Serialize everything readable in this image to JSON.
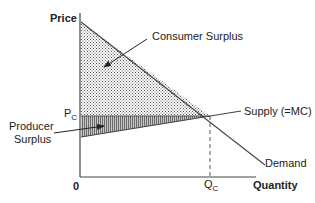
{
  "diagram": {
    "type": "supply-demand",
    "axes": {
      "y_label": "Price",
      "x_label": "Quantity",
      "origin_label": "0"
    },
    "labels": {
      "consumer_surplus": "Consumer Surplus",
      "producer_surplus_line1": "Producer",
      "producer_surplus_line2": "Surplus",
      "supply": "Supply (=MC)",
      "demand": "Demand",
      "price_equilibrium_main": "P",
      "price_equilibrium_sub": "C",
      "quantity_equilibrium_main": "Q",
      "quantity_equilibrium_sub": "C"
    },
    "regions": [
      {
        "name": "Consumer Surplus",
        "pattern": "dots"
      },
      {
        "name": "Producer Surplus",
        "pattern": "vertical-lines"
      }
    ],
    "colors": {
      "line": "#333333",
      "text": "#222222",
      "background": "#ffffff"
    }
  }
}
